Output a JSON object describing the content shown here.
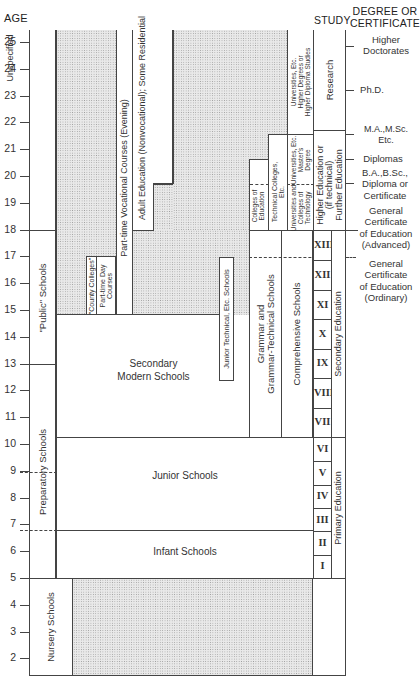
{
  "header": {
    "age_label": "AGE",
    "study_label": "STUDY",
    "degree_label_line1": "DEGREE OR",
    "degree_label_line2": "CERTIFICATE"
  },
  "age_axis": {
    "top_label": "Unspecified",
    "ticks": [
      "25",
      "24",
      "23",
      "22",
      "21",
      "20",
      "19",
      "18",
      "17",
      "16",
      "15",
      "14",
      "13",
      "12",
      "11",
      "10",
      "9",
      "8",
      "7",
      "6",
      "5",
      "4",
      "3",
      "2"
    ]
  },
  "institutions": {
    "public_schools": "\"Public\" Schools",
    "preparatory_schools": "Preparatory Schools",
    "nursery_schools": "Nursery Schools",
    "county_colleges": "\"County Colleges\"",
    "part_time_day_line1": "Part-time Day",
    "part_time_day_line2": "Courses",
    "part_time_vocational": "Part-time Vocational Courses (Evening)",
    "adult_education": "Adult Education (Nonvocational); Some Residential",
    "junior_technical": "Junior Technical, Etc. Schools",
    "secondary_modern_line1": "Secondary",
    "secondary_modern_line2": "Modern Schools",
    "grammar_line1": "Grammar  and",
    "grammar_line2": "Grammar-Technical  Schools",
    "comprehensive": "Comprehensive  Schools",
    "colleges_of_education_line1": "Colleges of",
    "colleges_of_education_line2": "Education",
    "technical_colleges_line1": "Technical Colleges,",
    "technical_colleges_line2": "Etc.",
    "universities_tech_line1": "Universities and",
    "universities_tech_line2": "Colleges of",
    "universities_tech_line3": "Technology",
    "universities_masters_line1": "Universities, Etc.",
    "universities_masters_line2": "Master's",
    "universities_masters_line3": "Degree",
    "universities_higher_line1": "Universities, Etc.",
    "universities_higher_line2": "Higher Degrees or",
    "universities_higher_line3": "Higher Diploma Studies",
    "junior_schools": "Junior Schools",
    "infant_schools": "Infant Schools"
  },
  "study": {
    "research": "Research",
    "higher_ed_line1": "Higher Education or",
    "higher_ed_line2": "(if technical)",
    "higher_ed_line3": "Further Education",
    "secondary_education": "Secondary Education",
    "primary_education": "Primary Education",
    "secondary_years": [
      "XIII",
      "XII",
      "XI",
      "X",
      "IX",
      "VIII",
      "VII"
    ],
    "primary_years": [
      "VI",
      "V",
      "IV",
      "III",
      "II",
      "I"
    ]
  },
  "degrees": {
    "higher_doctorates_line1": "Higher",
    "higher_doctorates_line2": "Doctorates",
    "phd": "Ph.D.",
    "ma_msc_line1": "M.A.,M.Sc.",
    "ma_msc_line2": "Etc.",
    "diplomas": "Diplomas",
    "ba_bsc_line1": "B.A.,B.Sc.,",
    "ba_bsc_line2": "Diploma or",
    "ba_bsc_line3": "Certificate",
    "gce_adv_line1": "General",
    "gce_adv_line2": "Certificate",
    "gce_adv_line3": "of Education",
    "gce_adv_line4": "(Advanced)",
    "gce_ord_line1": "General",
    "gce_ord_line2": "Certificate",
    "gce_ord_line3": "of Education",
    "gce_ord_line4": "(Ordinary)"
  }
}
